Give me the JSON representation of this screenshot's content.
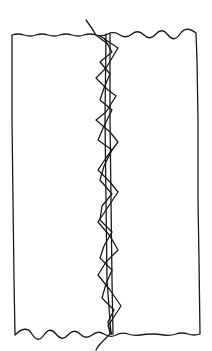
{
  "diagram": {
    "colors": {
      "ink": "#1a1a1a",
      "background": "#ffffff"
    },
    "panel": {
      "left": 12,
      "top": 34,
      "right": 198,
      "bottom": 334
    },
    "seam": {
      "center_x": 109,
      "thread_start": [
        86,
        20
      ],
      "thread_end": [
        96,
        350
      ]
    }
  }
}
